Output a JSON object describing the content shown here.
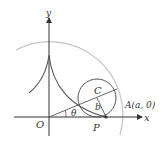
{
  "diagram": {
    "type": "hypocycloid-construction",
    "labels": {
      "y_axis": "y",
      "x_axis": "x",
      "origin": "O",
      "center": "C",
      "radius_small": "b",
      "point_A": "A(a, 0)",
      "point_P": "P",
      "angle": "θ"
    },
    "colors": {
      "curve": "#555555",
      "axes": "#333333",
      "big_circle": "#bbbbbb",
      "text": "#333333"
    }
  }
}
